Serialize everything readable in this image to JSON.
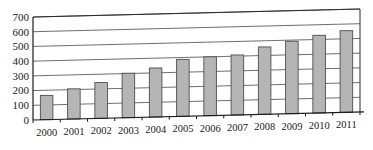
{
  "chart_data": {
    "type": "bar",
    "title": "",
    "subtitle": "",
    "xlabel": "",
    "ylabel": "",
    "categories": [
      "2000",
      "2001",
      "2002",
      "2003",
      "2004",
      "2005",
      "2006",
      "2007",
      "2008",
      "2009",
      "2010",
      "2011"
    ],
    "values": [
      165,
      205,
      243,
      302,
      333,
      387,
      400,
      408,
      458,
      492,
      528,
      555
    ],
    "ylim": [
      0,
      700
    ],
    "ytick_labels": [
      "700",
      "600",
      "500",
      "400",
      "300",
      "200",
      "100",
      "0"
    ],
    "ytick_values": [
      700,
      600,
      500,
      400,
      300,
      200,
      100,
      0
    ],
    "ytick_step": 100,
    "grid": true,
    "legend": null,
    "legend_position": "none",
    "annotations": [],
    "style": {
      "bar_fill": "#b5b5b5",
      "bar_stroke": "#4d4d4d",
      "grid_stroke": "#4a4a4a",
      "axis_stroke": "#1a1a1a",
      "text_color": "#1a1a1a",
      "background": "#ffffff",
      "perspective": true
    }
  }
}
